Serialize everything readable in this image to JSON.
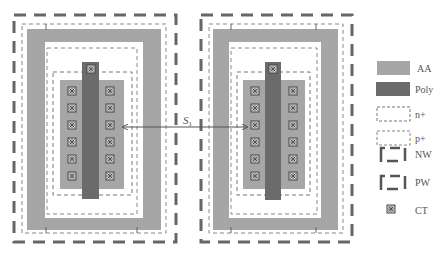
{
  "colors": {
    "aa": "#a6a6a6",
    "poly": "#6b6b6b",
    "dash": "#666666",
    "thin_dash": "#888888",
    "contact": "#555555"
  },
  "spacing_label": {
    "symbol": "S",
    "subscript": "1"
  },
  "legend": {
    "items": [
      {
        "id": "aa",
        "label": "AA"
      },
      {
        "id": "poly",
        "label": "Poly"
      },
      {
        "id": "nplus",
        "label": "n+"
      },
      {
        "id": "pplus",
        "label": "p+"
      },
      {
        "id": "nw",
        "label": "NW"
      },
      {
        "id": "pw",
        "label": "PW"
      },
      {
        "id": "ct",
        "label": "CT"
      }
    ]
  },
  "devices": [
    {
      "name": "left-transistor",
      "contact_rows": 6,
      "contact_columns": 2
    },
    {
      "name": "right-transistor",
      "contact_rows": 6,
      "contact_columns": 2
    }
  ]
}
